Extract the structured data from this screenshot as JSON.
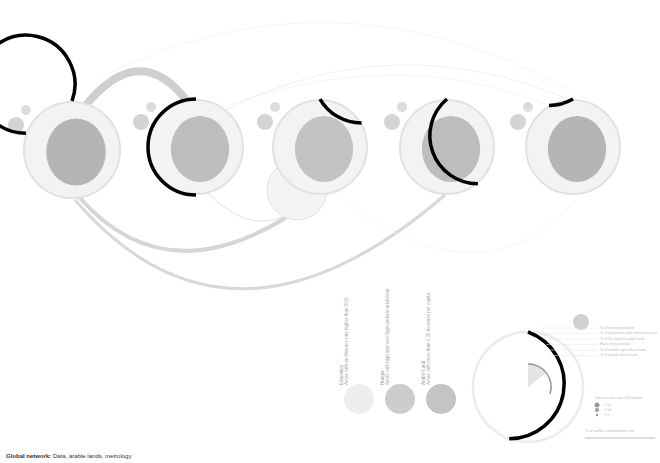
{
  "footer": {
    "title": "Global network:",
    "subtitle": "Data, arable lands, metrology"
  },
  "regions": [
    {
      "name": "North America",
      "cx": 72,
      "cy": 150,
      "r": 48,
      "arc_start": 0,
      "arc_end": 290,
      "fill": "#b5b5b5"
    },
    {
      "name": "Europe",
      "cx": 196,
      "cy": 147,
      "r": 47,
      "arc_start": 0,
      "arc_end": 180,
      "fill": "#bdbdbd"
    },
    {
      "name": "Asia / Oceania",
      "cx": 320,
      "cy": 147,
      "r": 47,
      "arc_start": 0,
      "arc_end": 60,
      "fill": "#c3c3c3"
    },
    {
      "name": "South America",
      "cx": 447,
      "cy": 147,
      "r": 47,
      "arc_start": 0,
      "arc_end": 140,
      "fill": "#bdbdbd"
    },
    {
      "name": "Africa",
      "cx": 573,
      "cy": 147,
      "r": 47,
      "arc_start": -30,
      "arc_end": 0,
      "fill": "#b5b5b5"
    }
  ],
  "legend": {
    "categories": [
      {
        "title": "Education",
        "desc": "Areas with an illiteracy rate higher than 50%",
        "color": "#eeeeee"
      },
      {
        "title": "Hunger",
        "desc": "Areas with high and very high undernourishment",
        "color": "#cccccc"
      },
      {
        "title": "Arable Land",
        "desc": "Areas with more than 0.30 hectares per capita",
        "color": "#c4c4c4"
      }
    ],
    "key_lines": [
      "% of world population",
      "% of population with internet access",
      "% of the world's arable land",
      "Ratio of population",
      "% of world's agricultural land",
      "% of world's forest land"
    ],
    "extras": [
      "Internet users per 100 people",
      "> 50",
      "5-50",
      "< 5",
      "% of world's export/import ratio"
    ],
    "donut": {
      "cx": 528,
      "cy": 387,
      "r": 55,
      "black_arc_start": 180,
      "black_arc_end": 360
    }
  }
}
